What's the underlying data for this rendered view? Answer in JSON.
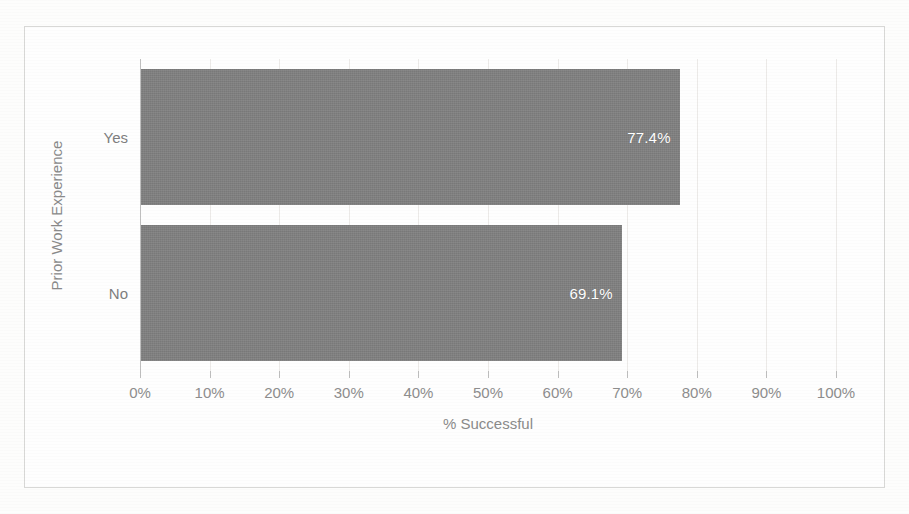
{
  "chart_data": {
    "type": "bar",
    "orientation": "horizontal",
    "title": "",
    "xlabel": "% Successful",
    "ylabel": "Prior Work Experience",
    "categories": [
      "Yes",
      "No"
    ],
    "values": [
      77.4,
      69.1
    ],
    "data_labels": [
      "77.4%",
      "69.1%"
    ],
    "xlim": [
      0,
      100
    ],
    "xticks": [
      0,
      10,
      20,
      30,
      40,
      50,
      60,
      70,
      80,
      90,
      100
    ],
    "xticklabels": [
      "0%",
      "10%",
      "20%",
      "30%",
      "40%",
      "50%",
      "60%",
      "70%",
      "80%",
      "90%",
      "100%"
    ],
    "grid": true,
    "grid_axis": "x",
    "legend": false,
    "legend_position": "none",
    "series": [
      {
        "name": "% Successful",
        "values": [
          77.4,
          69.1
        ]
      }
    ],
    "colors": {
      "bar": "#808080",
      "data_label_text": "#ffffff",
      "tick_label_text": "#8d8d8d",
      "axis_title_text": "#8a8a8a",
      "gridline": "#eceae8",
      "axis_line": "#bfbfbf",
      "chart_border": "#d8d8d6",
      "plot_background": "#fefefe"
    }
  }
}
